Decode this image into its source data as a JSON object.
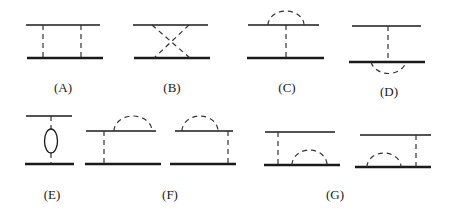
{
  "diagram": {
    "colors": {
      "line": "#1a1a1a",
      "dashed": "#333333",
      "background": "#ffffff"
    },
    "panels": [
      {
        "id": "A",
        "label": "(A)",
        "type": "ladder",
        "exchanges": 2
      },
      {
        "id": "B",
        "label": "(B)",
        "type": "crossed",
        "exchanges": 2
      },
      {
        "id": "C",
        "label": "(C)",
        "type": "vertical exchange with loop on top line"
      },
      {
        "id": "D",
        "label": "(D)",
        "type": "vertical exchange with loop on bottom line"
      },
      {
        "id": "E",
        "label": "(E)",
        "type": "exchange line with bubble insertion"
      },
      {
        "id": "F",
        "label": "(F)",
        "type": "exchange plus top-line loop (two variants)"
      },
      {
        "id": "G",
        "label": "(G)",
        "type": "exchange plus bottom-line loop (two variants)"
      }
    ]
  }
}
